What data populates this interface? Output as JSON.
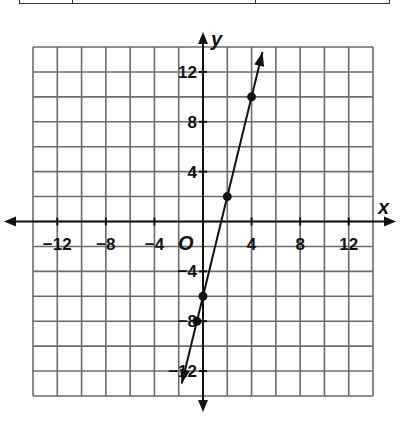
{
  "chart_data": {
    "type": "line",
    "title": "",
    "xlabel": "x",
    "ylabel": "y",
    "origin_label": "O",
    "xlim": [
      -14,
      14
    ],
    "ylim": [
      -14,
      14
    ],
    "grid": true,
    "grid_step": 2,
    "x_ticks": [
      -12,
      -8,
      -4,
      4,
      8,
      12
    ],
    "y_ticks": [
      12,
      8,
      4,
      -4,
      -8,
      -12
    ],
    "x_tick_labels": [
      "−12",
      "−8",
      "−4",
      "4",
      "8",
      "12"
    ],
    "y_tick_labels": [
      "12",
      "8",
      "4",
      "−4",
      "−8",
      "−12"
    ],
    "series": [
      {
        "name": "y = 4x - 6",
        "line_extends_both_ways": true,
        "points": [
          {
            "x": -0.5,
            "y": -8
          },
          {
            "x": 0,
            "y": -6
          },
          {
            "x": 2,
            "y": 2
          },
          {
            "x": 4,
            "y": 10
          }
        ],
        "line_start": {
          "x": -1.75,
          "y": -13
        },
        "line_end": {
          "x": 4.9,
          "y": 13.6
        }
      }
    ],
    "legend": null
  },
  "colors": {
    "grid": "#6b6b6b",
    "axis": "#111111",
    "line": "#111111"
  }
}
